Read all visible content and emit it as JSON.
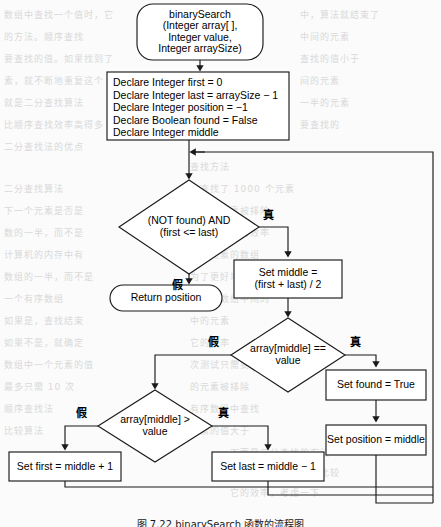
{
  "figure": {
    "type": "flowchart",
    "caption": "图 7.22  binarySearch 函数的流程图",
    "language_labels": {
      "true": "真",
      "false": "假"
    },
    "stroke_color": "#1a1a1a",
    "fill_color": "#ffffff",
    "page_background": "#fbfbfb"
  },
  "nodes": {
    "start": {
      "shape": "terminator",
      "lines": [
        "binarySearch",
        "(Integer array[ ],",
        "Integer value,",
        "Integer arraySize)"
      ]
    },
    "declare": {
      "shape": "process",
      "lines": [
        "Declare Integer first = 0",
        "Declare Integer last = arraySize − 1",
        "Declare Integer position = −1",
        "Declare Boolean found = False",
        "Declare Integer middle"
      ]
    },
    "loop_condition": {
      "shape": "decision",
      "lines": [
        "(NOT found) AND",
        "(first <= last)"
      ],
      "true_label": "真",
      "false_label": "假"
    },
    "return_position": {
      "shape": "terminator",
      "lines": [
        "Return position"
      ]
    },
    "set_middle": {
      "shape": "process",
      "lines": [
        "Set middle =",
        "(first + last) / 2"
      ]
    },
    "cmp_equal": {
      "shape": "decision",
      "lines": [
        "array[middle] ==",
        "value"
      ],
      "true_label": "真",
      "false_label": "假"
    },
    "set_found_true": {
      "shape": "process",
      "lines": [
        "Set found = True"
      ]
    },
    "set_position_middle": {
      "shape": "process",
      "lines": [
        "Set position = middle"
      ]
    },
    "cmp_greater": {
      "shape": "decision",
      "lines": [
        "array[middle] >",
        "value"
      ],
      "true_label": "真",
      "false_label": "假"
    },
    "set_first": {
      "shape": "process",
      "lines": [
        "Set first = middle + 1"
      ]
    },
    "set_last": {
      "shape": "process",
      "lines": [
        "Set last = middle − 1"
      ]
    }
  },
  "ghost_text": [
    {
      "x": 4,
      "y": 8,
      "t": "数组中查找一个值时，它"
    },
    {
      "x": 150,
      "y": 8,
      "t": "小的元素"
    },
    {
      "x": 300,
      "y": 8,
      "t": "中，算法就结束了"
    },
    {
      "x": 4,
      "y": 30,
      "t": "的方法。顺序查找"
    },
    {
      "x": 300,
      "y": 30,
      "t": "中间的元素"
    },
    {
      "x": 4,
      "y": 52,
      "t": "要查找的值。如果找到了"
    },
    {
      "x": 300,
      "y": 52,
      "t": "查找的值小于"
    },
    {
      "x": 4,
      "y": 74,
      "t": "素，就不断地重复这个"
    },
    {
      "x": 300,
      "y": 74,
      "t": "间的元素"
    },
    {
      "x": 4,
      "y": 96,
      "t": "就是二分查找算法"
    },
    {
      "x": 300,
      "y": 96,
      "t": "一半的元素"
    },
    {
      "x": 4,
      "y": 118,
      "t": "比顺序查找效率高得多"
    },
    {
      "x": 300,
      "y": 118,
      "t": "要查找的"
    },
    {
      "x": 4,
      "y": 140,
      "t": "二分查找法的优点"
    },
    {
      "x": 190,
      "y": 160,
      "t": "查找方法"
    },
    {
      "x": 4,
      "y": 182,
      "t": "二分查找算法"
    },
    {
      "x": 190,
      "y": 182,
      "t": "小查找了 1000 个元素"
    },
    {
      "x": 4,
      "y": 204,
      "t": "下一个元素是否是"
    },
    {
      "x": 190,
      "y": 204,
      "t": "一半的元素被排除"
    },
    {
      "x": 4,
      "y": 226,
      "t": "数的一半，而不是"
    },
    {
      "x": 190,
      "y": 226,
      "t": "二分查找法的效率"
    },
    {
      "x": 4,
      "y": 248,
      "t": "计算机的内存中有"
    },
    {
      "x": 190,
      "y": 248,
      "t": "千个元素的数组"
    },
    {
      "x": 4,
      "y": 270,
      "t": "数组的一半，而不是"
    },
    {
      "x": 190,
      "y": 270,
      "t": "为了更好地理解"
    },
    {
      "x": 4,
      "y": 292,
      "t": "一个有序数组"
    },
    {
      "x": 190,
      "y": 292,
      "t": "的值与数组中间的"
    },
    {
      "x": 4,
      "y": 314,
      "t": "如果是，查找结束"
    },
    {
      "x": 190,
      "y": 314,
      "t": "中的元素"
    },
    {
      "x": 4,
      "y": 336,
      "t": "如果不是，就确定"
    },
    {
      "x": 190,
      "y": 336,
      "t": "它的效率"
    },
    {
      "x": 4,
      "y": 358,
      "t": "数组中一个元素的值"
    },
    {
      "x": 190,
      "y": 358,
      "t": "次测试只需要"
    },
    {
      "x": 4,
      "y": 380,
      "t": "最多只需 10 次"
    },
    {
      "x": 190,
      "y": 380,
      "t": "的元素被排除"
    },
    {
      "x": 4,
      "y": 402,
      "t": "顺序查找法"
    },
    {
      "x": 190,
      "y": 402,
      "t": "有序数组中查找"
    },
    {
      "x": 4,
      "y": 424,
      "t": "比较算法"
    },
    {
      "x": 190,
      "y": 424,
      "t": "元素的值大于"
    },
    {
      "x": 230,
      "y": 446,
      "t": "下面是二分查找的方法"
    },
    {
      "x": 230,
      "y": 466,
      "t": "数字的中间元素开始比较"
    },
    {
      "x": 230,
      "y": 486,
      "t": "它的效率，考虑一下"
    }
  ]
}
